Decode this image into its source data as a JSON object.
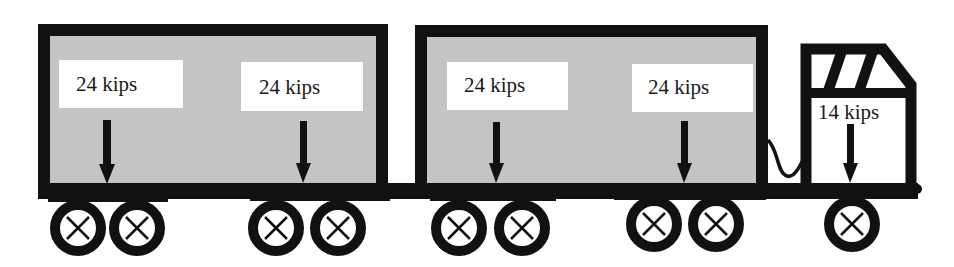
{
  "figure": {
    "colors": {
      "frame": "#111111",
      "trailer_fill": "#c4c4c4",
      "label_box": "#ffffff",
      "background": "#ffffff"
    }
  },
  "loads": [
    {
      "id": "trailer1-rear",
      "label": "24 kips",
      "value": 24,
      "unit": "kips"
    },
    {
      "id": "trailer1-front",
      "label": "24 kips",
      "value": 24,
      "unit": "kips"
    },
    {
      "id": "trailer2-rear",
      "label": "24 kips",
      "value": 24,
      "unit": "kips"
    },
    {
      "id": "trailer2-front",
      "label": "24 kips",
      "value": 24,
      "unit": "kips"
    },
    {
      "id": "cab-steer",
      "label": "14 kips",
      "value": 14,
      "unit": "kips"
    }
  ],
  "wheels_count": 9
}
